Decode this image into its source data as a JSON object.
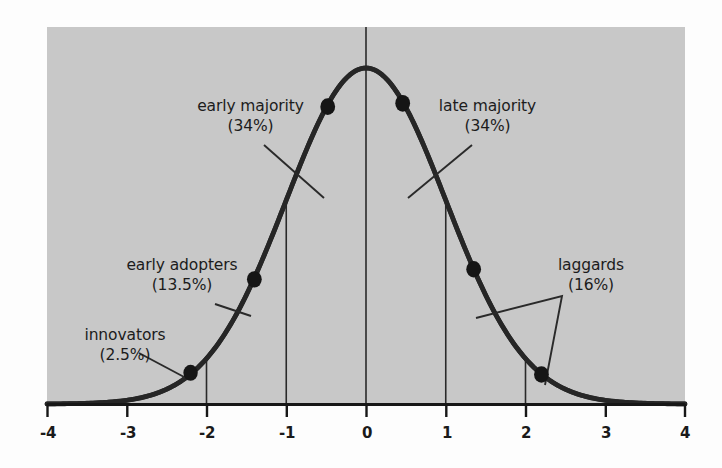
{
  "chart_data": {
    "type": "area",
    "title": "",
    "subtitle": "",
    "xlabel": "",
    "ylabel": "",
    "grid": false,
    "legend_position": "none",
    "xlim": [
      -4,
      4
    ],
    "ylim": [
      0,
      0.42
    ],
    "x_ticks": [
      "-4",
      "-3",
      "-2",
      "-1",
      "0",
      "1",
      "2",
      "3",
      "4"
    ],
    "x_tick_values": [
      -4,
      -3,
      -2,
      -1,
      0,
      1,
      2,
      3,
      4
    ],
    "curve": {
      "name": "normal distribution",
      "formula": "standard normal bell curve",
      "mean": 0,
      "sd": 1,
      "color": "#2a2a2a"
    },
    "plot_background": "#c8c8c8",
    "dividers": [
      {
        "x": -2,
        "label": "innovators / early adopters boundary"
      },
      {
        "x": -1,
        "label": "early adopters / early majority boundary"
      },
      {
        "x": 0,
        "label": "center line"
      },
      {
        "x": 1,
        "label": "early majority / late majority boundary"
      },
      {
        "x": 2,
        "label": "late majority / laggards boundary"
      }
    ],
    "segments": [
      {
        "name": "innovators",
        "percent": "2.5%",
        "value": 2.5,
        "range": [
          -4,
          -2
        ]
      },
      {
        "name": "early adopters",
        "percent": "13.5%",
        "value": 13.5,
        "range": [
          -2,
          -1
        ]
      },
      {
        "name": "early majority",
        "percent": "34%",
        "value": 34,
        "range": [
          -1,
          0
        ]
      },
      {
        "name": "late majority",
        "percent": "34%",
        "value": 34,
        "range": [
          0,
          1
        ]
      },
      {
        "name": "laggards",
        "percent": "16%",
        "value": 16,
        "range": [
          1,
          4
        ]
      }
    ],
    "markers": [
      {
        "x": -2.2,
        "y": 0.037,
        "for": "innovators"
      },
      {
        "x": -1.4,
        "y": 0.148,
        "for": "early adopters"
      },
      {
        "x": -0.48,
        "y": 0.353,
        "for": "early majority"
      },
      {
        "x": 0.46,
        "y": 0.357,
        "for": "late majority"
      },
      {
        "x": 1.35,
        "y": 0.16,
        "for": "laggards"
      },
      {
        "x": 2.2,
        "y": 0.035,
        "for": "laggards"
      }
    ]
  },
  "annotations": {
    "innovators": {
      "name": "innovators",
      "percent": "(2.5%)"
    },
    "early_adopters": {
      "name": "early adopters",
      "percent": "(13.5%)"
    },
    "early_majority": {
      "name": "early majority",
      "percent": "(34%)"
    },
    "late_majority": {
      "name": "late majority",
      "percent": "(34%)"
    },
    "laggards": {
      "name": "laggards",
      "percent": "(16%)"
    }
  },
  "axis": {
    "ticks": [
      {
        "label": "-4"
      },
      {
        "label": "-3"
      },
      {
        "label": "-2"
      },
      {
        "label": "-1"
      },
      {
        "label": "0"
      },
      {
        "label": "1"
      },
      {
        "label": "2"
      },
      {
        "label": "3"
      },
      {
        "label": "4"
      }
    ]
  },
  "colors": {
    "plot_fill": "#c8c8c8",
    "curve": "#262626",
    "axis": "#171717",
    "text": "#1c1c1c",
    "page": "#fdfdfd"
  }
}
